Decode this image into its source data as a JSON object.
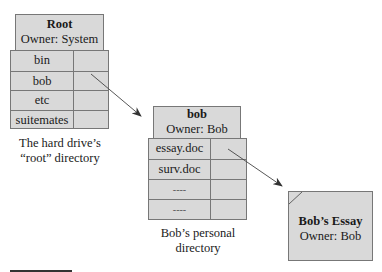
{
  "root_directory": {
    "title": "Root",
    "owner": "Owner: System",
    "entries": [
      {
        "name": "bin"
      },
      {
        "name": "bob"
      },
      {
        "name": "etc"
      },
      {
        "name": "suitemates"
      }
    ],
    "caption_line1": "The hard drive’s",
    "caption_line2": "“root” directory"
  },
  "bob_directory": {
    "title": "bob",
    "owner": "Owner: Bob",
    "entries": [
      {
        "name": "essay.doc"
      },
      {
        "name": "surv.doc"
      },
      {
        "name": "----"
      },
      {
        "name": "----"
      }
    ],
    "caption_line1": "Bob’s personal",
    "caption_line2": "directory"
  },
  "essay_file": {
    "title": "Bob’s Essay",
    "owner": "Owner: Bob"
  },
  "arrows": [
    {
      "from": "root.bob",
      "to": "bob_directory"
    },
    {
      "from": "bob.essay.doc",
      "to": "essay_file"
    }
  ],
  "colors": {
    "box_fill": "#d9d9d9",
    "border": "#777777",
    "arrow": "#333333"
  }
}
